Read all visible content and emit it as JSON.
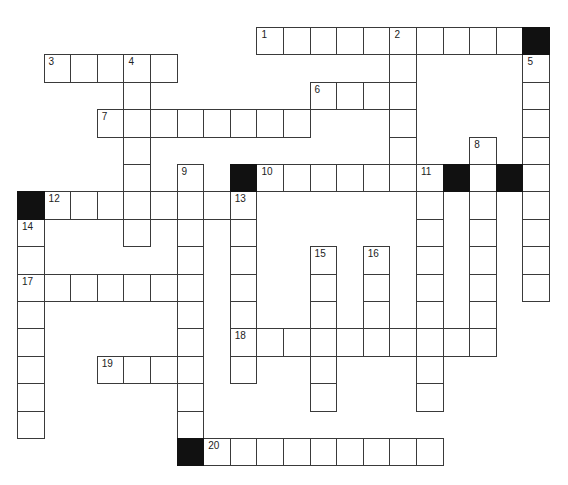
{
  "puzzle": {
    "type": "crossword",
    "grid": {
      "origin_x": 17,
      "origin_y": 27,
      "cell_w": 26.6,
      "cell_h": 27.4,
      "colors": {
        "line": "#3a3a3a",
        "block": "#111111",
        "fill": "#ffffff"
      }
    },
    "clues": {
      "across": [
        {
          "number": "1",
          "row": 0,
          "col": 9,
          "length": 10
        },
        {
          "number": "3",
          "row": 1,
          "col": 1,
          "length": 5
        },
        {
          "number": "6",
          "row": 2,
          "col": 11,
          "length": 4
        },
        {
          "number": "7",
          "row": 3,
          "col": 3,
          "length": 8
        },
        {
          "number": "10",
          "row": 5,
          "col": 9,
          "length": 7
        },
        {
          "number": "12",
          "row": 6,
          "col": 1,
          "length": 8
        },
        {
          "number": "17",
          "row": 9,
          "col": 0,
          "length": 7
        },
        {
          "number": "18",
          "row": 11,
          "col": 8,
          "length": 10
        },
        {
          "number": "19",
          "row": 12,
          "col": 3,
          "length": 4
        },
        {
          "number": "20",
          "row": 15,
          "col": 7,
          "length": 9
        }
      ],
      "down": [
        {
          "number": "2",
          "row": 0,
          "col": 14,
          "length": 6
        },
        {
          "number": "4",
          "row": 1,
          "col": 4,
          "length": 7
        },
        {
          "number": "5",
          "row": 1,
          "col": 19,
          "length": 9
        },
        {
          "number": "8",
          "row": 4,
          "col": 17,
          "length": 8
        },
        {
          "number": "9",
          "row": 5,
          "col": 6,
          "length": 10
        },
        {
          "number": "11",
          "row": 5,
          "col": 15,
          "length": 9
        },
        {
          "number": "13",
          "row": 6,
          "col": 8,
          "length": 7
        },
        {
          "number": "14",
          "row": 7,
          "col": 0,
          "length": 8
        },
        {
          "number": "15",
          "row": 8,
          "col": 11,
          "length": 6
        },
        {
          "number": "16",
          "row": 8,
          "col": 13,
          "length": 4
        }
      ]
    },
    "black_cells": [
      {
        "row": 0,
        "col": 19
      },
      {
        "row": 5,
        "col": 8
      },
      {
        "row": 5,
        "col": 16
      },
      {
        "row": 5,
        "col": 18
      },
      {
        "row": 6,
        "col": 0
      },
      {
        "row": 15,
        "col": 6
      }
    ]
  }
}
